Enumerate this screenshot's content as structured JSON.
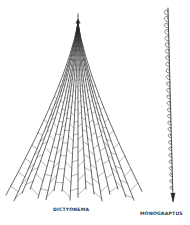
{
  "figure": {
    "specimens": [
      {
        "name": "DICTYONEMA",
        "form": "conical net-like rhabdosome with radiating branches and dissepiments"
      },
      {
        "name": "MONOGRAPTUS",
        "form": "single straight stipe with hooked thecae along one side"
      }
    ]
  },
  "labels": {
    "dictyonema": "DICTYONEMA",
    "monograptus": "MONOGRAPTUS"
  },
  "colors": {
    "ink": "#2a2a2a",
    "background": "#ffffff"
  }
}
